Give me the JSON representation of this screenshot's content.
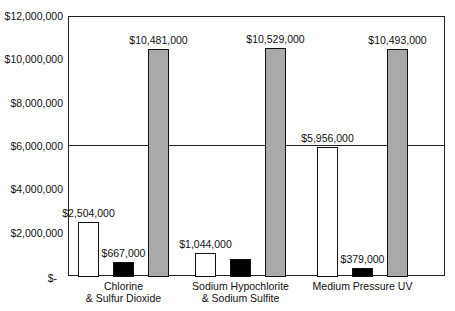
{
  "chart_data": {
    "type": "bar",
    "title": "",
    "xlabel": "",
    "ylabel": "",
    "ylim": [
      0,
      12000000
    ],
    "yticks": [
      0,
      2000000,
      4000000,
      6000000,
      8000000,
      10000000,
      12000000
    ],
    "ytick_labels": [
      "$-",
      "$2,000,000",
      "$4,000,000",
      "$6,000,000",
      "$8,000,000",
      "$10,000,000",
      "$12,000,000"
    ],
    "gridlines": [
      6000000
    ],
    "legend": "none",
    "categories": [
      [
        "Chlorine",
        "& Sulfur Dioxide"
      ],
      [
        "Sodium Hypochlorite",
        "& Sodium Sulfite"
      ],
      [
        "Medium Pressure UV"
      ]
    ],
    "series": [
      {
        "name": "Series 1 (white)",
        "color": "#ffffff",
        "values": [
          2504000,
          1044000,
          5956000
        ],
        "labels": [
          "$2,504,000",
          "$1,044,000",
          "$5,956,000"
        ]
      },
      {
        "name": "Series 2 (black)",
        "color": "#000000",
        "values": [
          667000,
          800000,
          379000
        ],
        "labels": [
          "$667,000",
          "",
          "$379,000"
        ]
      },
      {
        "name": "Series 3 (gray)",
        "color": "#a9a9a9",
        "values": [
          10481000,
          10529000,
          10493000
        ],
        "labels": [
          "$10,481,000",
          "$10,529,000",
          "$10,493,000"
        ]
      }
    ]
  }
}
